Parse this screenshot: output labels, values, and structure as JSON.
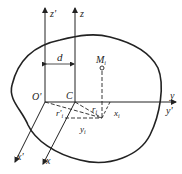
{
  "diagram": {
    "type": "coordinate-system-cross-section",
    "labels": {
      "z_prime": "z'",
      "z": "z",
      "d": "d",
      "M_i": "M",
      "M_i_sub": "i",
      "O_prime": "O'",
      "C": "C",
      "y": "y",
      "y_prime": "y'",
      "r_prime_i": "r'",
      "r_prime_i_sub": "i",
      "r_i": "r",
      "r_i_sub": "i",
      "x_i": "x",
      "x_i_sub": "i",
      "y_i": "y",
      "y_i_sub": "i",
      "x_prime": "x'",
      "x": "x"
    },
    "colors": {
      "stroke": "#222222",
      "background": "#ffffff"
    }
  }
}
